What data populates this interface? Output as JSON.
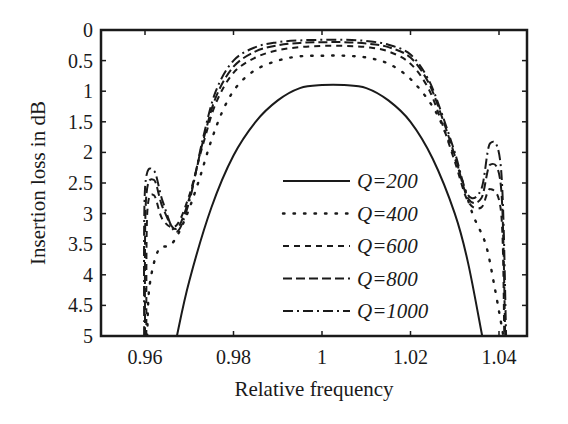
{
  "chart_data": {
    "type": "line",
    "title": "",
    "xlabel": "Relative frequency",
    "ylabel": "Insertion loss in dB",
    "xlim": [
      0.95,
      1.0465
    ],
    "ylim": [
      0,
      5
    ],
    "y_inverted": true,
    "grid": false,
    "legend_position": "inside-lower-center",
    "x_ticks": [
      0.96,
      0.98,
      1,
      1.02,
      1.04
    ],
    "x_tick_labels": [
      "0.96",
      "0.98",
      "1",
      "1.02",
      "1.04"
    ],
    "y_ticks": [
      0,
      0.5,
      1,
      1.5,
      2,
      2.5,
      3,
      3.5,
      4,
      4.5,
      5
    ],
    "y_tick_labels": [
      "0",
      "0.5",
      "1",
      "1.5",
      "2",
      "2.5",
      "3",
      "3.5",
      "4",
      "4.5",
      "5"
    ],
    "series": [
      {
        "name": "Q=200",
        "dash": "solid",
        "x": [
          0.9672,
          0.97,
          0.975,
          0.98,
          0.985,
          0.99,
          0.995,
          1.0,
          1.005,
          1.01,
          1.015,
          1.02,
          1.025,
          1.03,
          1.033,
          1.0362
        ],
        "values": [
          5.0,
          4.1,
          2.9,
          2.05,
          1.5,
          1.15,
          0.95,
          0.9,
          0.9,
          0.95,
          1.15,
          1.5,
          2.1,
          3.0,
          3.8,
          5.0
        ]
      },
      {
        "name": "Q=400",
        "dash": "dotted",
        "x": [
          0.9605,
          0.961,
          0.963,
          0.966,
          0.969,
          0.972,
          0.975,
          0.978,
          0.981,
          0.985,
          0.99,
          0.995,
          1.0,
          1.005,
          1.01,
          1.015,
          1.02,
          1.025,
          1.028,
          1.031,
          1.034,
          1.037,
          1.039,
          1.041
        ],
        "values": [
          5.0,
          4.2,
          3.6,
          3.5,
          3.1,
          2.5,
          1.8,
          1.25,
          0.9,
          0.65,
          0.5,
          0.43,
          0.42,
          0.42,
          0.45,
          0.55,
          0.8,
          1.25,
          1.7,
          2.3,
          3.0,
          3.5,
          4.2,
          5.0
        ]
      },
      {
        "name": "Q=600",
        "dash": "dashed",
        "x": [
          0.9603,
          0.9605,
          0.962,
          0.964,
          0.967,
          0.97,
          0.973,
          0.976,
          0.98,
          0.985,
          0.99,
          0.995,
          1.0,
          1.005,
          1.01,
          1.015,
          1.02,
          1.024,
          1.027,
          1.03,
          1.033,
          1.036,
          1.038,
          1.0405,
          1.0412
        ],
        "values": [
          5.0,
          3.0,
          2.7,
          3.1,
          3.2,
          2.7,
          1.9,
          1.2,
          0.7,
          0.45,
          0.33,
          0.28,
          0.26,
          0.26,
          0.28,
          0.35,
          0.55,
          0.95,
          1.5,
          2.15,
          2.8,
          2.9,
          2.6,
          3.0,
          5.0
        ]
      },
      {
        "name": "Q=800",
        "dash": "long-dashed",
        "x": [
          0.96,
          0.9602,
          0.962,
          0.964,
          0.967,
          0.97,
          0.973,
          0.976,
          0.98,
          0.985,
          0.99,
          0.995,
          1.0,
          1.005,
          1.01,
          1.015,
          1.02,
          1.024,
          1.027,
          1.03,
          1.033,
          1.036,
          1.038,
          1.0405,
          1.0414
        ],
        "values": [
          5.0,
          2.8,
          2.45,
          2.9,
          3.25,
          2.75,
          1.85,
          1.1,
          0.6,
          0.35,
          0.25,
          0.21,
          0.2,
          0.2,
          0.22,
          0.28,
          0.45,
          0.85,
          1.4,
          2.05,
          2.75,
          2.75,
          2.2,
          2.6,
          5.0
        ]
      },
      {
        "name": "Q=1000",
        "dash": "dash-dot",
        "x": [
          0.9598,
          0.96,
          0.962,
          0.964,
          0.967,
          0.97,
          0.973,
          0.976,
          0.98,
          0.985,
          0.99,
          0.995,
          1.0,
          1.005,
          1.01,
          1.015,
          1.02,
          1.024,
          1.027,
          1.03,
          1.033,
          1.036,
          1.038,
          1.0405,
          1.0416
        ],
        "values": [
          5.0,
          2.6,
          2.3,
          2.8,
          3.3,
          2.8,
          1.8,
          1.0,
          0.5,
          0.28,
          0.2,
          0.17,
          0.16,
          0.16,
          0.18,
          0.24,
          0.4,
          0.8,
          1.35,
          2.0,
          2.7,
          2.6,
          1.85,
          2.3,
          5.0
        ]
      }
    ]
  },
  "axes": {
    "xlabel": "Relative frequency",
    "ylabel": "Insertion loss in dB"
  },
  "legend": {
    "items": [
      {
        "label": "Q=200",
        "style": "solid"
      },
      {
        "label": "Q=400",
        "style": "dotted"
      },
      {
        "label": "Q=600",
        "style": "dashed"
      },
      {
        "label": "Q=800",
        "style": "long-dashed"
      },
      {
        "label": "Q=1000",
        "style": "dash-dot"
      }
    ]
  },
  "colors": {
    "line": "#1a1a1a",
    "background": "#ffffff"
  }
}
